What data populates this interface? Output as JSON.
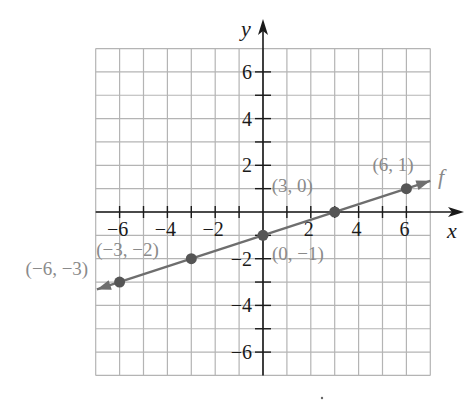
{
  "chart_data": {
    "type": "line",
    "title": "",
    "xlabel": "x",
    "ylabel": "y",
    "function_label": "f",
    "xlim": [
      -7,
      7
    ],
    "ylim": [
      -7,
      7
    ],
    "grid": true,
    "x_ticks": [
      -6,
      -4,
      -2,
      2,
      4,
      6
    ],
    "y_ticks": [
      -6,
      -4,
      -2,
      2,
      4,
      6
    ],
    "x_tick_labels": [
      "−6",
      "−4",
      "−2",
      "2",
      "4",
      "6"
    ],
    "y_tick_labels": [
      "−6",
      "−4",
      "−2",
      "2",
      "4",
      "6"
    ],
    "series": [
      {
        "name": "f",
        "equation": "y = x/3 - 1",
        "points": [
          {
            "x": -6,
            "y": -3,
            "label": "(−6, −3)"
          },
          {
            "x": -3,
            "y": -2,
            "label": "(−3, −2)"
          },
          {
            "x": 0,
            "y": -1,
            "label": "(0, −1)"
          },
          {
            "x": 3,
            "y": 0,
            "label": "(3, 0)"
          },
          {
            "x": 6,
            "y": 1,
            "label": "(6, 1)"
          }
        ]
      }
    ]
  },
  "colors": {
    "grid": "#b4b4b4",
    "axis": "#1a1a1a",
    "line": "#6e6e6e",
    "point": "#555555",
    "point_label": "#8a8a8a",
    "tick_label": "#1a1a1a"
  }
}
